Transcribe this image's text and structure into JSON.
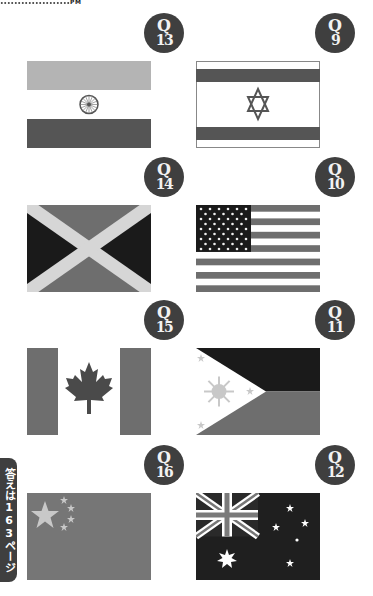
{
  "header": {
    "marker_text": "PM"
  },
  "side_tab": {
    "label": "答えは163ページ"
  },
  "questions": [
    {
      "q_label": "Q",
      "number": "13",
      "country": "India"
    },
    {
      "q_label": "Q",
      "number": "9",
      "country": "Israel"
    },
    {
      "q_label": "Q",
      "number": "14",
      "country": "Jamaica"
    },
    {
      "q_label": "Q",
      "number": "10",
      "country": "United States"
    },
    {
      "q_label": "Q",
      "number": "15",
      "country": "Canada"
    },
    {
      "q_label": "Q",
      "number": "11",
      "country": "Philippines"
    },
    {
      "q_label": "Q",
      "number": "16",
      "country": "China"
    },
    {
      "q_label": "Q",
      "number": "12",
      "country": "Australia"
    }
  ],
  "colors": {
    "badge": "#3f3f3f",
    "dark": "#2a2a2a",
    "mid": "#6e6e6e",
    "light": "#b4b4b4",
    "pale": "#d6d6d6"
  }
}
